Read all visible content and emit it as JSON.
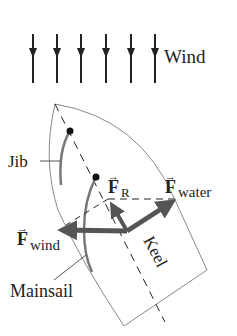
{
  "diagram": {
    "wind_label": "Wind",
    "wind_arrow_count": 6,
    "labels": {
      "jib": "Jib",
      "mainsail": "Mainsail",
      "keel": "Keel"
    },
    "forces": [
      {
        "symbol": "F",
        "subscript": "R",
        "name": "resultant-force"
      },
      {
        "symbol": "F",
        "subscript": "water",
        "name": "water-force"
      },
      {
        "symbol": "F",
        "subscript": "wind",
        "name": "wind-force"
      }
    ],
    "colors": {
      "force_arrow": "#555555",
      "hull_outline": "#888888",
      "sail": "#777777",
      "text": "#222222"
    }
  }
}
